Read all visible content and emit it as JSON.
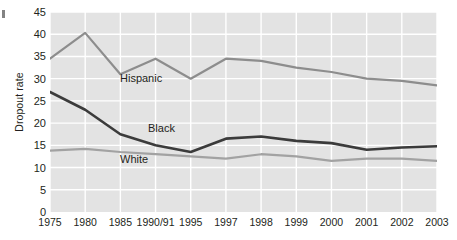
{
  "chart_data": {
    "type": "line",
    "title": "",
    "xlabel": "",
    "ylabel": "Dropout rate",
    "categories": [
      "1975",
      "1980",
      "1985",
      "1990/91",
      "1995",
      "1997",
      "1998",
      "1999",
      "2000",
      "2001",
      "2002",
      "2003"
    ],
    "ylim": [
      0,
      45
    ],
    "ytick_step": 5,
    "yticks": [
      "0",
      "5",
      "10",
      "15",
      "20",
      "25",
      "30",
      "35",
      "40",
      "45"
    ],
    "grid": true,
    "legend_position": "inline-labels",
    "plot_background": "#e3e3e3",
    "gridline_color": "#ffffff",
    "series": [
      {
        "name": "Hispanic",
        "color": "#8d8d8d",
        "values": [
          34.5,
          40.3,
          31.0,
          34.5,
          30.0,
          34.5,
          34.0,
          32.5,
          31.5,
          30.0,
          29.5,
          28.5
        ]
      },
      {
        "name": "Black",
        "color": "#3b3b3b",
        "values": [
          27.0,
          23.0,
          17.5,
          15.0,
          13.5,
          16.5,
          17.0,
          16.0,
          15.5,
          14.0,
          14.5,
          14.8
        ]
      },
      {
        "name": "White",
        "color": "#a2a2a2",
        "values": [
          13.8,
          14.2,
          13.5,
          13.0,
          12.5,
          12.0,
          13.0,
          12.5,
          11.5,
          12.0,
          12.0,
          11.5
        ]
      }
    ],
    "series_label_positions": [
      {
        "name": "Hispanic",
        "left": 120,
        "top": 72
      },
      {
        "name": "Black",
        "left": 148,
        "top": 122
      },
      {
        "name": "White",
        "left": 120,
        "top": 153
      }
    ]
  }
}
